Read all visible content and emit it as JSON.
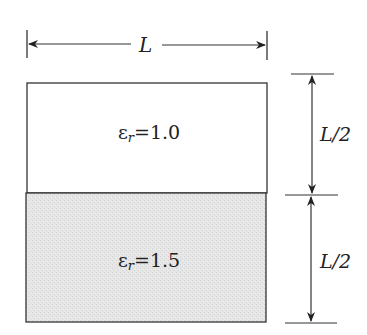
{
  "diagram": {
    "type": "two-layer dielectric slab cross-section",
    "width_dimension": {
      "label": "L"
    },
    "layers": [
      {
        "name": "upper",
        "symbol": "ε",
        "subscript": "r",
        "equals": "=",
        "value": "1.0",
        "fill": "#ffffff",
        "height_label": "L/2"
      },
      {
        "name": "lower",
        "symbol": "ε",
        "subscript": "r",
        "equals": "=",
        "value": "1.5",
        "fill": "#e4e4e4",
        "height_label": "L/2"
      }
    ],
    "colors": {
      "line": "#333333",
      "fill_lower": "#e4e4e4",
      "background": "#ffffff"
    }
  }
}
